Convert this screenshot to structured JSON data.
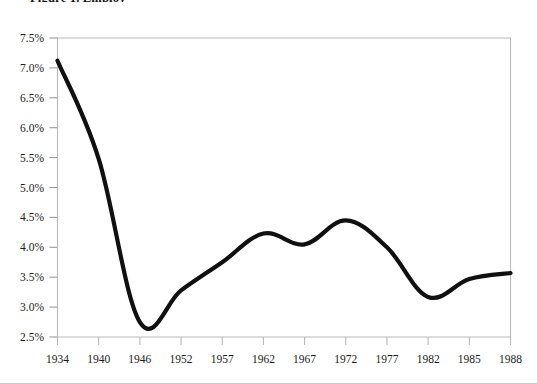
{
  "figure": {
    "title_visible_fragment": "Figure 1. Employ"
  },
  "chart_data": {
    "type": "line",
    "title": "",
    "xlabel": "",
    "ylabel": "",
    "categories": [
      "1934",
      "1940",
      "1946",
      "1952",
      "1957",
      "1962",
      "1967",
      "1972",
      "1977",
      "1982",
      "1985",
      "1988"
    ],
    "x": [
      1934,
      1940,
      1946,
      1952,
      1957,
      1962,
      1967,
      1972,
      1977,
      1982,
      1985,
      1988
    ],
    "values": [
      7.12,
      5.48,
      2.75,
      3.28,
      3.75,
      4.23,
      4.05,
      4.45,
      4.0,
      3.17,
      3.47,
      3.57
    ],
    "series": [
      {
        "name": "rate",
        "values": [
          7.12,
          5.48,
          2.75,
          3.28,
          3.75,
          4.23,
          4.05,
          4.45,
          4.0,
          3.17,
          3.47,
          3.57
        ],
        "color": "#101010"
      }
    ],
    "ylim": [
      2.5,
      7.5
    ],
    "yticks": [
      2.5,
      3.0,
      3.5,
      4.0,
      4.5,
      5.0,
      5.5,
      6.0,
      6.5,
      7.0,
      7.5
    ],
    "ytick_labels": [
      "2.5%",
      "3.0%",
      "3.5%",
      "4.0%",
      "4.5%",
      "5.0%",
      "5.5%",
      "6.0%",
      "6.5%",
      "7.0%",
      "7.5%"
    ],
    "xtick_labels": [
      "1934",
      "1940",
      "1946",
      "1952",
      "1957",
      "1962",
      "1967",
      "1972",
      "1977",
      "1982",
      "1985",
      "1988"
    ],
    "grid": false,
    "legend": null,
    "legend_position": "none",
    "annotations": []
  }
}
